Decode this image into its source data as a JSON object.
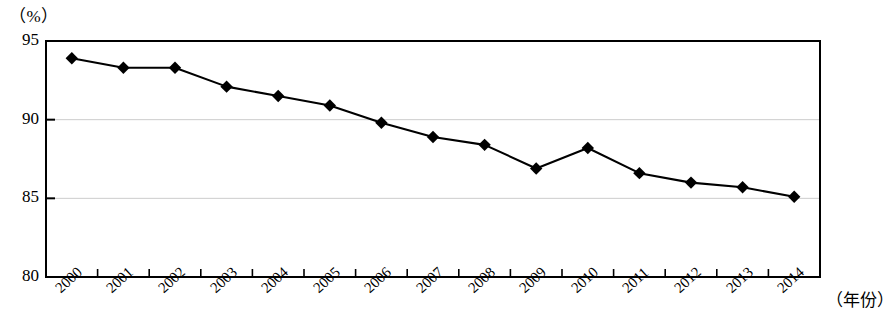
{
  "chart_data": {
    "type": "line",
    "title": "",
    "subtitle": "",
    "xlabel": "（年份）",
    "ylabel": "（%）",
    "unit_label": "（%）",
    "categories": [
      "2000",
      "2001",
      "2002",
      "2003",
      "2004",
      "2005",
      "2006",
      "2007",
      "2008",
      "2009",
      "2010",
      "2011",
      "2012",
      "2013",
      "2014"
    ],
    "values": [
      93.9,
      93.3,
      93.3,
      92.1,
      91.5,
      90.9,
      89.8,
      88.9,
      88.4,
      86.9,
      88.2,
      86.6,
      86.0,
      85.7,
      85.1
    ],
    "series": [
      {
        "name": "",
        "values": [
          93.9,
          93.3,
          93.3,
          92.1,
          91.5,
          90.9,
          89.8,
          88.9,
          88.4,
          86.9,
          88.2,
          86.6,
          86.0,
          85.7,
          85.1
        ]
      }
    ],
    "ylim": [
      80,
      95
    ],
    "yticks": [
      80,
      85,
      90,
      95
    ],
    "ytick_labels": [
      "80",
      "85",
      "90",
      "95"
    ],
    "grid": true,
    "gridlines_at": [
      85,
      90
    ],
    "legend": "none",
    "marker": "diamond",
    "marker_color": "#000000",
    "line_color": "#000000",
    "axis_color": "#000000",
    "grid_color": "#cccccc",
    "background": "#ffffff",
    "xtick_rotation": -42
  },
  "plot": {
    "left": 46,
    "right": 820,
    "top": 41,
    "bottom": 277
  }
}
